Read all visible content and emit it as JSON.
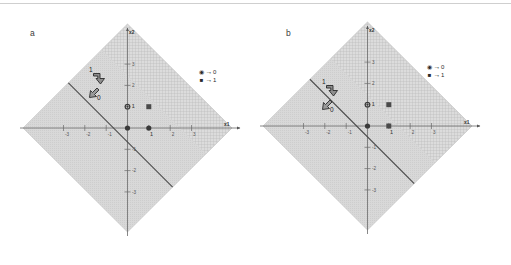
{
  "figure": {
    "background": "#ffffff",
    "border_color": "#cfcfcf",
    "panels": [
      {
        "id": "a",
        "label": "a",
        "axes": {
          "xlabel": "x1",
          "ylabel": "x2",
          "xticks": [
            "-3",
            "-2",
            "-1",
            "1",
            "2",
            "3"
          ],
          "xtick_values": [
            -3,
            -2,
            -1,
            1,
            2,
            3
          ],
          "yticks": [
            "3",
            "2",
            "1",
            "-1",
            "-2",
            "-3"
          ],
          "ytick_values": [
            3,
            2,
            1,
            -1,
            -2,
            -3
          ],
          "xlim": [
            -3.6,
            3.6
          ],
          "ylim": [
            -3.6,
            3.6
          ]
        },
        "legend": [
          {
            "marker": "circle",
            "arrow": "→",
            "value": "0"
          },
          {
            "marker": "square",
            "arrow": "→",
            "value": "1"
          }
        ],
        "points": [
          {
            "x": 0,
            "y": 0,
            "marker": "circle",
            "class": "0"
          },
          {
            "x": 0,
            "y": 1,
            "marker": "circle",
            "class": "0",
            "label": "1"
          },
          {
            "x": 1,
            "y": 0,
            "marker": "circle",
            "class": "0",
            "label": "1"
          },
          {
            "x": 1,
            "y": 1,
            "marker": "square",
            "class": "1"
          }
        ],
        "decision_line": {
          "equation": "x1 + x2 = 1.5",
          "slope": -1,
          "intercept": 1.5,
          "color": "#444444"
        },
        "vectors": [
          {
            "label": "1",
            "from": [
              -0.85,
              2.55
            ],
            "to": [
              -0.35,
              2.05
            ],
            "direction": "down-right"
          },
          {
            "label": "0",
            "from": [
              -1.25,
              1.55
            ],
            "to": [
              -1.55,
              1.25
            ],
            "direction": "down-left"
          }
        ],
        "region_shape": "diamond",
        "shading": {
          "upper_right": "grid-hatch",
          "lower_left": "solid-gray"
        },
        "colors": {
          "fill_light": "#d9d9d9",
          "fill_hatch": "#cccccc",
          "line": "#4a4a4a",
          "marker": "#3a3a3a"
        }
      },
      {
        "id": "b",
        "label": "b",
        "axes": {
          "xlabel": "x1",
          "ylabel": "x2",
          "xticks": [
            "-3",
            "-2",
            "-1",
            "1",
            "2",
            "3"
          ],
          "xtick_values": [
            -3,
            -2,
            -1,
            1,
            2,
            3
          ],
          "yticks": [
            "3",
            "2",
            "1",
            "-1",
            "-2",
            "-3"
          ],
          "ytick_values": [
            3,
            2,
            1,
            -1,
            -2,
            -3
          ],
          "xlim": [
            -3.6,
            3.6
          ],
          "ylim": [
            -3.6,
            3.6
          ]
        },
        "legend": [
          {
            "marker": "circle",
            "arrow": "→",
            "value": "0"
          },
          {
            "marker": "square",
            "arrow": "→",
            "value": "1"
          }
        ],
        "points": [
          {
            "x": 0,
            "y": 0,
            "marker": "circle",
            "class": "0"
          },
          {
            "x": 0,
            "y": 1,
            "marker": "circle",
            "class": "0",
            "label": "1"
          },
          {
            "x": 1,
            "y": 0,
            "marker": "square",
            "class": "1",
            "label": "1"
          },
          {
            "x": 1,
            "y": 1,
            "marker": "square",
            "class": "1"
          }
        ],
        "decision_line": {
          "equation": "x1 + x2 = 0.5",
          "slope": -1,
          "intercept": 0.5,
          "color": "#444444"
        },
        "vectors": [
          {
            "label": "1",
            "from": [
              -1.45,
              1.75
            ],
            "to": [
              -0.95,
              1.25
            ],
            "direction": "down-right"
          },
          {
            "label": "0",
            "from": [
              -1.75,
              0.85
            ],
            "to": [
              -2.05,
              0.55
            ],
            "direction": "down-left"
          }
        ],
        "region_shape": "diamond",
        "shading": {
          "upper_right": "grid-hatch",
          "lower_left": "solid-gray"
        },
        "colors": {
          "fill_light": "#d9d9d9",
          "fill_hatch": "#cccccc",
          "line": "#4a4a4a",
          "marker": "#3a3a3a"
        }
      }
    ]
  }
}
